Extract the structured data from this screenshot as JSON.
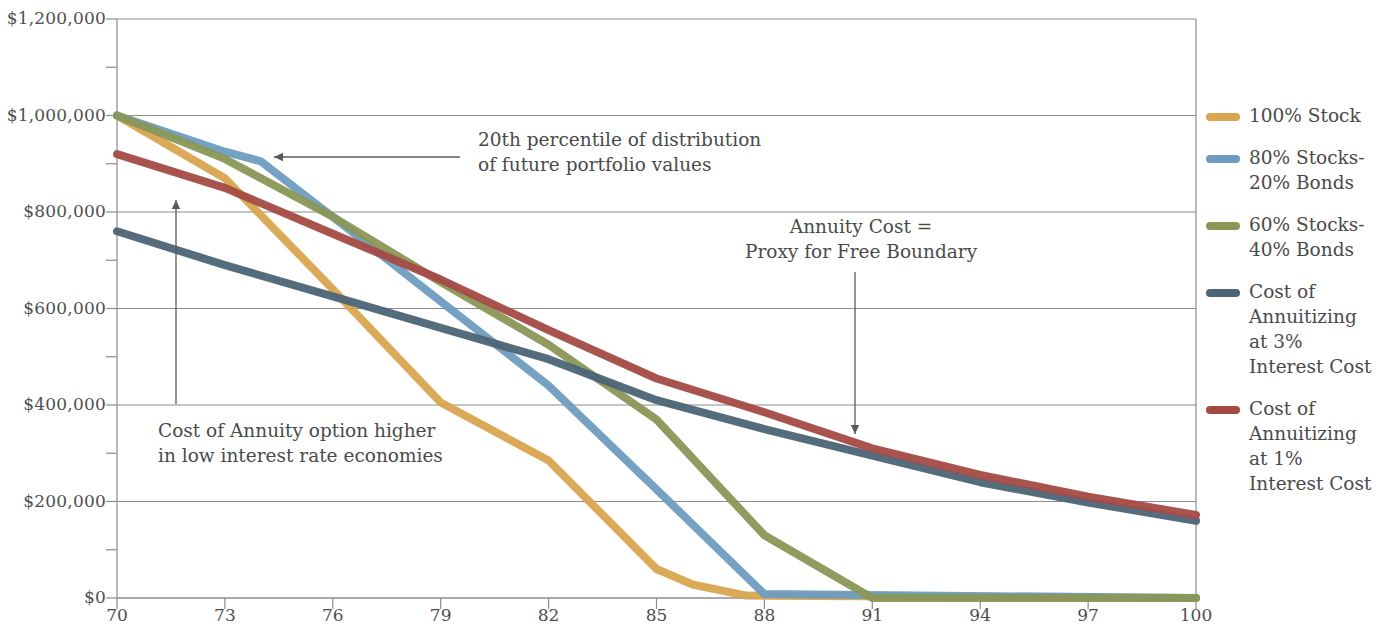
{
  "chart_data": {
    "type": "line",
    "title": "",
    "xlabel": "",
    "ylabel": "",
    "xlim": [
      70,
      100
    ],
    "ylim": [
      0,
      1200000
    ],
    "grid": true,
    "legend_position": "right",
    "x_ticks": [
      70,
      73,
      76,
      79,
      82,
      85,
      88,
      91,
      94,
      97,
      100
    ],
    "x_tick_labels": [
      "70",
      "73",
      "76",
      "79",
      "82",
      "85",
      "88",
      "91",
      "94",
      "97",
      "100"
    ],
    "y_ticks": [
      0,
      200000,
      400000,
      600000,
      800000,
      1000000,
      1200000
    ],
    "y_tick_labels": [
      "$0",
      "$200,000",
      "$400,000",
      "$600,000",
      "$800,000",
      "$1,000,000",
      "$1,200,000"
    ],
    "y_minor_ticks": [
      100000,
      300000,
      500000,
      700000,
      900000,
      1100000
    ],
    "series": [
      {
        "name": "100% Stock",
        "color": "#d8a550",
        "x": [
          70,
          73,
          76,
          79,
          82,
          85,
          86,
          87.5,
          100
        ],
        "values": [
          1000000,
          870000,
          640000,
          405000,
          285000,
          60000,
          28000,
          5000,
          0
        ]
      },
      {
        "name": "80% Stocks-20% Bonds",
        "color": "#6e9cc0",
        "x": [
          70,
          73,
          74,
          76,
          79,
          82,
          85,
          88,
          100
        ],
        "values": [
          1000000,
          925000,
          905000,
          790000,
          615000,
          440000,
          225000,
          8000,
          0
        ]
      },
      {
        "name": "60% Stocks-40% Bonds",
        "color": "#8a9656",
        "x": [
          70,
          73,
          76,
          79,
          82,
          85,
          88,
          91,
          100
        ],
        "values": [
          1000000,
          910000,
          790000,
          655000,
          525000,
          370000,
          130000,
          0,
          0
        ]
      },
      {
        "name": "Cost of Annuitizing at 3% Interest Cost",
        "color": "#4c6475",
        "x": [
          70,
          73,
          76,
          79,
          82,
          85,
          88,
          91,
          94,
          97,
          100
        ],
        "values": [
          760000,
          690000,
          625000,
          560000,
          495000,
          410000,
          350000,
          295000,
          240000,
          198000,
          160000
        ]
      },
      {
        "name": "Cost of Annuitizing at 1% Interest Cost",
        "color": "#a44a45",
        "x": [
          70,
          73,
          76,
          79,
          82,
          85,
          88,
          91,
          94,
          97,
          100
        ],
        "values": [
          920000,
          850000,
          755000,
          660000,
          555000,
          455000,
          385000,
          310000,
          255000,
          210000,
          172000
        ]
      }
    ],
    "annotations": [
      {
        "id": "percentile",
        "text": "20th percentile of distribution\nof future portfolio values",
        "arrow": "left"
      },
      {
        "id": "annuity-cost",
        "text": "Annuity Cost =\nProxy for Free Boundary",
        "arrow": "down"
      },
      {
        "id": "low-rate",
        "text": "Cost of Annuity option higher\nin low interest rate economies",
        "arrow": "up"
      }
    ]
  },
  "legend": {
    "items": [
      {
        "label": "100% Stock",
        "color": "#d8a550"
      },
      {
        "label": "80% Stocks-\n20% Bonds",
        "color": "#6e9cc0"
      },
      {
        "label": "60% Stocks-\n40% Bonds",
        "color": "#8a9656"
      },
      {
        "label": "Cost of\nAnnuitizing\nat 3%\nInterest Cost",
        "color": "#4c6475"
      },
      {
        "label": "Cost of\nAnnuitizing\nat 1%\nInterest Cost",
        "color": "#a44a45"
      }
    ]
  },
  "axis": {
    "y_labels": [
      "$1,200,000",
      "$1,000,000",
      "$800,000",
      "$600,000",
      "$400,000",
      "$200,000",
      "$0"
    ],
    "x_labels": [
      "70",
      "73",
      "76",
      "79",
      "82",
      "85",
      "88",
      "91",
      "94",
      "97",
      "100"
    ]
  },
  "colors": {
    "gridline": "#8c8c8c",
    "axis": "#8c8c8c",
    "text": "#4a4a4a",
    "background": "#ffffff"
  }
}
